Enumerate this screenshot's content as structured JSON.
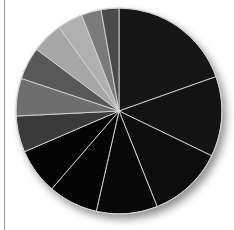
{
  "chart_data": {
    "type": "pie",
    "title": "",
    "start_angle_deg": 0,
    "direction": "clockwise",
    "legend": "none",
    "labels_visible": false,
    "categories": [
      "S1",
      "S2",
      "S3",
      "S4",
      "S5",
      "S6",
      "S7",
      "S8",
      "S9",
      "S10",
      "S11",
      "S12",
      "S13"
    ],
    "values": [
      19.6,
      12.6,
      11.8,
      9.6,
      7.8,
      7.2,
      5.7,
      5.9,
      5.1,
      4.9,
      4.0,
      3.1,
      2.8
    ],
    "colors": [
      "#161616",
      "#131313",
      "#0d0d0d",
      "#080808",
      "#050505",
      "#050505",
      "#3a3a3a",
      "#6e6e6e",
      "#585858",
      "#a6a6a6",
      "#b0b0b0",
      "#7a7a7a",
      "#4a4a4a"
    ],
    "separator_color": "#d8d8d8",
    "center": [
      119,
      111
    ],
    "radius": 103
  }
}
